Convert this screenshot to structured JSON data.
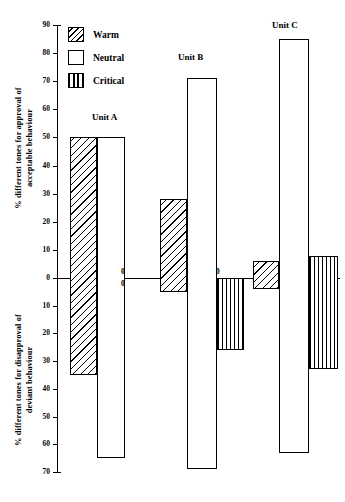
{
  "chart_data": {
    "type": "bar",
    "title": "",
    "subtitle": "",
    "orientation": "vertical",
    "grid": false,
    "legend_position": "top-left",
    "xlabel": "",
    "ylabel_top": "% different tones for approval of\nacceptable behaviour",
    "ylabel_bottom": "% different tones for disapproval of\ndeviant behaviour",
    "ylim": [
      -70,
      90
    ],
    "yticks_top": [
      0,
      10,
      20,
      30,
      40,
      50,
      60,
      70,
      80,
      90
    ],
    "yticks_bottom": [
      0,
      10,
      20,
      30,
      40,
      50,
      60,
      70
    ],
    "ytick_labels_top": [
      "0",
      "10",
      "20",
      "30",
      "40",
      "50",
      "60",
      "70",
      "80",
      "90"
    ],
    "ytick_labels_bottom": [
      "0",
      "10",
      "20",
      "30",
      "40",
      "50",
      "60",
      "70"
    ],
    "categories": [
      "Unit A",
      "Unit B",
      "Unit C"
    ],
    "series": [
      {
        "name": "Warm",
        "pattern": "diagonal-hatch",
        "values_top": [
          50,
          28,
          6
        ],
        "values_bottom": [
          35,
          5,
          4
        ]
      },
      {
        "name": "Neutral",
        "pattern": "solid-white",
        "values_top": [
          50,
          71,
          85
        ],
        "values_bottom": [
          65,
          69,
          63
        ]
      },
      {
        "name": "Critical",
        "pattern": "vertical-lines",
        "values_top": [
          0,
          0,
          8
        ],
        "values_bottom": [
          0,
          26,
          33
        ]
      }
    ],
    "annotations": [
      {
        "text": "0",
        "category": "Unit A",
        "series": "Critical",
        "side": "above"
      },
      {
        "text": "0",
        "category": "Unit A",
        "series": "Critical",
        "side": "below"
      },
      {
        "text": "0",
        "category": "Unit B",
        "series": "Critical",
        "side": "above"
      }
    ]
  },
  "legend": {
    "items": [
      {
        "label": "Warm",
        "swatch": "diagonal-hatch-swatch"
      },
      {
        "label": "Neutral",
        "swatch": "white-swatch"
      },
      {
        "label": "Critical",
        "swatch": "vertical-lines-swatch"
      }
    ]
  },
  "axis": {
    "top_label": "% different tones for approval of\nacceptable behaviour",
    "bottom_label": "% different tones for disapproval of\ndeviant behaviour"
  },
  "groups": [
    {
      "label": "Unit A"
    },
    {
      "label": "Unit B"
    },
    {
      "label": "Unit C"
    }
  ]
}
